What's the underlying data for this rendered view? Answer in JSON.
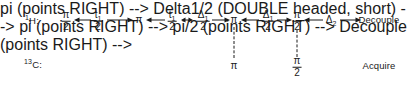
{
  "diagram": {
    "background_color": "#ffffff",
    "ink_color": "#1a1a1a",
    "channels": [
      {
        "id": "h1",
        "label_nucleus": "H",
        "label_mass": "1",
        "label_suffix": ":",
        "label_text": "¹H:"
      },
      {
        "id": "c13",
        "label_nucleus": "C",
        "label_mass": "13",
        "label_suffix": ":",
        "label_text": "¹³C:"
      }
    ],
    "proton_channel": {
      "elements": [
        {
          "kind": "fraction",
          "numerator": "π",
          "num_sub": "",
          "denominator": "2",
          "text": "π/2"
        },
        {
          "kind": "fraction",
          "numerator": "t",
          "num_sub": "1",
          "denominator": "2",
          "text": "t₁/2"
        },
        {
          "kind": "symbol",
          "text": "π",
          "sub": ""
        },
        {
          "kind": "fraction",
          "numerator": "t",
          "num_sub": "1",
          "denominator": "2",
          "text": "t₁/2"
        },
        {
          "kind": "fraction",
          "numerator": "Δ",
          "num_sub": "1",
          "denominator": "2",
          "text": "Δ₁/2"
        },
        {
          "kind": "symbol",
          "text": "π",
          "sub": ""
        },
        {
          "kind": "fraction",
          "numerator": "Δ",
          "num_sub": "1",
          "denominator": "2",
          "text": "Δ₁/2"
        },
        {
          "kind": "fraction",
          "numerator": "π",
          "num_sub": "",
          "denominator": "2",
          "text": "π/2"
        },
        {
          "kind": "symbol",
          "text": "Δ",
          "sub": "2"
        },
        {
          "kind": "word",
          "text": "Decouple"
        }
      ]
    },
    "carbon_channel": {
      "elements": [
        {
          "kind": "symbol",
          "text": "π",
          "sub": ""
        },
        {
          "kind": "fraction",
          "numerator": "π",
          "num_sub": "",
          "denominator": "2",
          "text": "π/2"
        },
        {
          "kind": "word",
          "text": "Acquire"
        }
      ]
    },
    "arrows": [
      {
        "id": "a1",
        "direction": "left",
        "from": "t1/2",
        "to": "pi/2"
      },
      {
        "id": "a2",
        "direction": "right",
        "from": "t1/2",
        "to": "pi"
      },
      {
        "id": "a3",
        "direction": "left",
        "from": "t1/2-2",
        "to": "pi"
      },
      {
        "id": "a4",
        "direction": "both",
        "from": "t1/2-2",
        "to": "delta1/2"
      },
      {
        "id": "a5",
        "direction": "right",
        "from": "delta1/2",
        "to": "pi-2"
      },
      {
        "id": "a6",
        "direction": "left",
        "from": "delta1/2-2",
        "to": "pi-2"
      },
      {
        "id": "a7",
        "direction": "right",
        "from": "delta1/2-2",
        "to": "pi/2-2"
      },
      {
        "id": "a8",
        "direction": "left",
        "from": "delta2",
        "to": "pi/2-2"
      },
      {
        "id": "a9",
        "direction": "right",
        "from": "delta2",
        "to": "Decouple"
      }
    ],
    "correlation_lines": [
      {
        "id": "v1",
        "top_element": "π",
        "bottom_element": "π"
      },
      {
        "id": "v2",
        "top_element": "π/2",
        "bottom_element": "π/2"
      }
    ]
  }
}
